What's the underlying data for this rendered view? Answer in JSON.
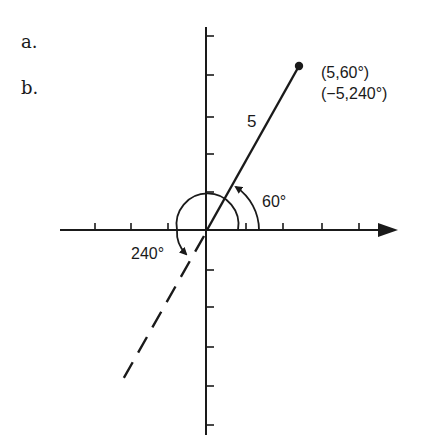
{
  "figure": {
    "parts": [
      {
        "label": "a."
      },
      {
        "label": "b."
      }
    ],
    "point": {
      "labels": [
        "(5,60°)",
        "(−5,240°)"
      ],
      "polar_forms": [
        {
          "r": 5,
          "theta_deg": 60
        },
        {
          "r": -5,
          "theta_deg": 240
        }
      ]
    },
    "segment_length_label": "5",
    "angle_labels": {
      "small_angle": "60°",
      "large_angle": "240°"
    },
    "axes": {
      "horizontal_ticks_each_side": 3,
      "vertical_ticks_each_side": 5
    },
    "colors": {
      "ink": "#1a1a1a",
      "background": "#ffffff"
    }
  }
}
